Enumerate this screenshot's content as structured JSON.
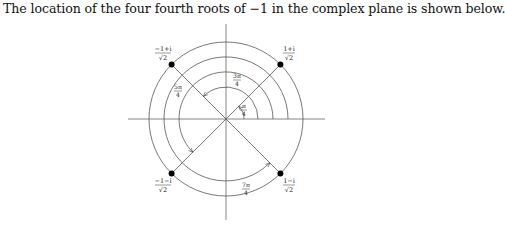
{
  "caption": "The location of the four fourth roots of −1 in the complex plane is shown below.",
  "diagram": {
    "center": [
      226,
      119
    ],
    "radii": [
      32,
      47,
      62,
      77
    ],
    "roots": [
      {
        "label_num": "1+i",
        "label_den": "√2",
        "angle": "π/4"
      },
      {
        "label_num": "−1+i",
        "label_den": "√2",
        "angle": "3π/4"
      },
      {
        "label_num": "−1−i",
        "label_den": "√2",
        "angle": "5π/4"
      },
      {
        "label_num": "1−i",
        "label_den": "√2",
        "angle": "7π/4"
      }
    ],
    "angle_labels": [
      {
        "num": "π",
        "den": "4"
      },
      {
        "num": "3π",
        "den": "4"
      },
      {
        "num": "5π",
        "den": "4"
      },
      {
        "num": "7π",
        "den": "4"
      }
    ],
    "colors": {
      "line": "#555555",
      "dot": "#000000",
      "text": "#222222"
    }
  }
}
